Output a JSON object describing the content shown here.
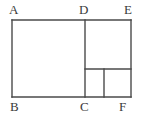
{
  "figure": {
    "kind": "geometry-diagram",
    "background_color": "#ffffff",
    "stroke_color": "#4a4a4a",
    "stroke_width": 1.4,
    "label_color": "#3a3a3a",
    "label_font_size": 13,
    "canvas": {
      "width": 143,
      "height": 117
    },
    "vertices": [
      {
        "id": "A",
        "label": "A",
        "x": 12,
        "y": 20,
        "label_x": 9,
        "label_y": 3
      },
      {
        "id": "D",
        "label": "D",
        "x": 85,
        "y": 20,
        "label_x": 79,
        "label_y": 3
      },
      {
        "id": "E",
        "label": "E",
        "x": 131,
        "y": 20,
        "label_x": 124,
        "label_y": 3
      },
      {
        "id": "B",
        "label": "B",
        "x": 12,
        "y": 97,
        "label_x": 10,
        "label_y": 100
      },
      {
        "id": "C",
        "label": "C",
        "x": 85,
        "y": 97,
        "label_x": 80,
        "label_y": 100
      },
      {
        "id": "F",
        "label": "F",
        "x": 131,
        "y": 97,
        "label_x": 119,
        "label_y": 100
      }
    ],
    "segments": [
      {
        "id": "top-edge-AE",
        "x1": 12,
        "y1": 20,
        "x2": 131,
        "y2": 20
      },
      {
        "id": "bottom-edge-BF",
        "x1": 12,
        "y1": 97,
        "x2": 131,
        "y2": 97
      },
      {
        "id": "left-edge-AB",
        "x1": 12,
        "y1": 20,
        "x2": 12,
        "y2": 97
      },
      {
        "id": "right-edge-EF",
        "x1": 131,
        "y1": 20,
        "x2": 131,
        "y2": 97
      },
      {
        "id": "divider-DC",
        "x1": 85,
        "y1": 20,
        "x2": 85,
        "y2": 97
      },
      {
        "id": "inner-horizontal",
        "x1": 85,
        "y1": 69,
        "x2": 131,
        "y2": 69
      },
      {
        "id": "inner-vertical",
        "x1": 104,
        "y1": 69,
        "x2": 104,
        "y2": 97
      }
    ]
  }
}
